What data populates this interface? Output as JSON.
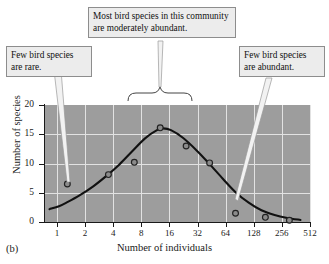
{
  "figure": {
    "panel_label": "(b)"
  },
  "annotations": [
    {
      "id": "rare",
      "text": "Few bird species are rare."
    },
    {
      "id": "moderate",
      "text": "Most bird species in this community are moderately abundant."
    },
    {
      "id": "abundant",
      "text": "Few bird species are abundant."
    }
  ],
  "chart_data": {
    "type": "scatter",
    "title": "",
    "xlabel": "Number of individuals",
    "ylabel": "Number of species",
    "xscale": "log2",
    "xticks": [
      1,
      2,
      4,
      8,
      16,
      32,
      64,
      128,
      256,
      512
    ],
    "xticklabels": [
      "1",
      "2",
      "4",
      "8",
      "16",
      "32",
      "64",
      "128",
      "256",
      "512"
    ],
    "yticks": [
      0,
      5,
      10,
      15,
      20
    ],
    "yticklabels": [
      "0",
      "5",
      "10",
      "15",
      "20"
    ],
    "ylim": [
      0,
      20
    ],
    "xlim": [
      0.55,
      660
    ],
    "grid": true,
    "grid_color": "#e2e2e2",
    "plot_background": "#9d9d9d",
    "legend": null,
    "points": [
      {
        "x": 1,
        "y": 6.5
      },
      {
        "x": 3,
        "y": 8.1
      },
      {
        "x": 6,
        "y": 10.2
      },
      {
        "x": 12,
        "y": 16.1
      },
      {
        "x": 24,
        "y": 13.0
      },
      {
        "x": 45,
        "y": 10.1
      },
      {
        "x": 90,
        "y": 1.5
      },
      {
        "x": 200,
        "y": 0.8
      },
      {
        "x": 380,
        "y": 0.3
      }
    ],
    "curve": {
      "name": "lognormal fit",
      "color": "#111111",
      "x": [
        0.62,
        0.8,
        1,
        1.4,
        2,
        2.8,
        4,
        5.6,
        8,
        11,
        13,
        16,
        22,
        32,
        45,
        64,
        90,
        128,
        180,
        256,
        360,
        512
      ],
      "y": [
        2.2,
        2.7,
        3.4,
        4.6,
        6.1,
        7.8,
        9.8,
        12.0,
        14.3,
        15.7,
        16.0,
        15.7,
        14.4,
        12.2,
        9.9,
        7.4,
        5.1,
        3.3,
        2.0,
        1.2,
        0.7,
        0.35
      ]
    },
    "marker": {
      "shape": "circle-open",
      "fill": "#8b8b8b",
      "edge": "#222222"
    }
  }
}
